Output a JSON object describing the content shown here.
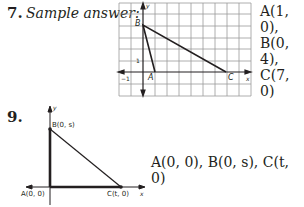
{
  "problem7": {
    "number": "7.",
    "label": "Sample answer:",
    "coords": [
      "A(1, 0),",
      "B(0, 4),",
      "C(7, 0)"
    ],
    "graph": {
      "point_labels": {
        "A": "A",
        "B": "B",
        "C": "C"
      },
      "axis_labels": {
        "x": "x",
        "y": "y"
      },
      "tick_labels": {
        "x_neg": "−1",
        "y_one": "1"
      }
    }
  },
  "problem9": {
    "number": "9.",
    "coords": "A(0, 0), B(0, s), C(t, 0)",
    "graph": {
      "point_labels": {
        "A": "A(0, 0)",
        "B": "B(0, s)",
        "C": "C(t, 0)"
      },
      "axis_labels": {
        "x": "x",
        "y": "y"
      }
    }
  }
}
